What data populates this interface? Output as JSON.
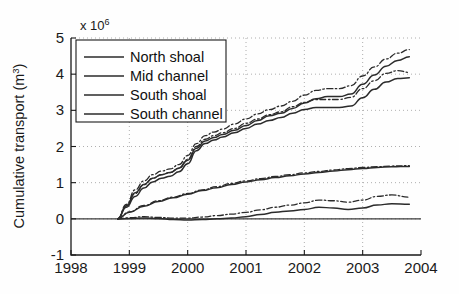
{
  "figure": {
    "axis_multiplier_base": "x 10",
    "axis_multiplier_exp": "6",
    "ylabel_main": "Cumulative transport (m",
    "ylabel_sup": "3",
    "ylabel_close": ")"
  },
  "legend": {
    "items": [
      {
        "label": "North shoal"
      },
      {
        "label": "Mid channel"
      },
      {
        "label": "South shoal"
      },
      {
        "label": "South channel"
      }
    ]
  },
  "chart_data": {
    "type": "line",
    "title": "",
    "xlabel": "",
    "ylabel": "Cumulative transport (m^3)",
    "y_multiplier": 1000000,
    "xlim": [
      1998,
      2004
    ],
    "ylim": [
      -1,
      5
    ],
    "xticks": [
      1998,
      1999,
      2000,
      2001,
      2002,
      2003,
      2004
    ],
    "xtick_labels": [
      "1998",
      "1999",
      "2000",
      "2001",
      "2002",
      "2003",
      "2004"
    ],
    "yticks": [
      -1,
      0,
      1,
      2,
      3,
      4,
      5
    ],
    "ytick_labels": [
      "-1",
      "0",
      "1",
      "2",
      "3",
      "4",
      "5"
    ],
    "grid": true,
    "grid_style": "dotted",
    "legend_position": "upper-left",
    "line_color": "#2b2b2b",
    "series": [
      {
        "name": "North shoal",
        "style": "solid",
        "x": [
          1998.8,
          1998.95,
          1999.1,
          1999.25,
          1999.4,
          1999.55,
          1999.7,
          1999.85,
          2000.0,
          2000.15,
          2000.3,
          2000.45,
          2000.6,
          2000.8,
          2001.0,
          2001.2,
          2001.4,
          2001.6,
          2001.8,
          2002.0,
          2002.2,
          2002.4,
          2002.6,
          2002.8,
          2003.0,
          2003.2,
          2003.4,
          2003.6,
          2003.8
        ],
        "values": [
          0.0,
          0.36,
          0.72,
          0.95,
          1.12,
          1.22,
          1.28,
          1.4,
          1.62,
          1.95,
          2.15,
          2.25,
          2.33,
          2.45,
          2.58,
          2.72,
          2.85,
          2.92,
          3.05,
          3.2,
          3.32,
          3.38,
          3.38,
          3.45,
          3.72,
          3.98,
          4.22,
          4.38,
          4.48
        ]
      },
      {
        "name": "North shoal (variant)",
        "style": "dashdot",
        "x": [
          1998.8,
          1998.95,
          1999.1,
          1999.25,
          1999.4,
          1999.55,
          1999.7,
          1999.85,
          2000.0,
          2000.15,
          2000.3,
          2000.45,
          2000.6,
          2000.8,
          2001.0,
          2001.2,
          2001.4,
          2001.6,
          2001.8,
          2002.0,
          2002.2,
          2002.4,
          2002.6,
          2002.8,
          2003.0,
          2003.2,
          2003.4,
          2003.6,
          2003.8
        ],
        "values": [
          0.0,
          0.4,
          0.8,
          1.05,
          1.22,
          1.32,
          1.38,
          1.5,
          1.75,
          2.08,
          2.3,
          2.4,
          2.48,
          2.62,
          2.76,
          2.9,
          3.02,
          3.12,
          3.25,
          3.42,
          3.55,
          3.6,
          3.6,
          3.68,
          3.95,
          4.2,
          4.42,
          4.58,
          4.68
        ]
      },
      {
        "name": "South shoal",
        "style": "solid",
        "x": [
          1998.8,
          1998.95,
          1999.1,
          1999.25,
          1999.4,
          1999.55,
          1999.7,
          1999.85,
          2000.0,
          2000.15,
          2000.3,
          2000.45,
          2000.6,
          2000.8,
          2001.0,
          2001.2,
          2001.4,
          2001.6,
          2001.8,
          2002.0,
          2002.2,
          2002.4,
          2002.6,
          2002.8,
          2003.0,
          2003.2,
          2003.4,
          2003.6,
          2003.8
        ],
        "values": [
          0.0,
          0.32,
          0.62,
          0.85,
          1.02,
          1.12,
          1.18,
          1.3,
          1.52,
          1.88,
          2.08,
          2.18,
          2.26,
          2.38,
          2.5,
          2.62,
          2.72,
          2.8,
          2.92,
          3.02,
          3.08,
          3.08,
          3.08,
          3.12,
          3.35,
          3.58,
          3.78,
          3.88,
          3.9
        ]
      },
      {
        "name": "South shoal (variant)",
        "style": "dashdot",
        "x": [
          1998.8,
          1998.95,
          1999.1,
          1999.25,
          1999.4,
          1999.55,
          1999.7,
          1999.85,
          2000.0,
          2000.15,
          2000.3,
          2000.45,
          2000.6,
          2000.8,
          2001.0,
          2001.2,
          2001.4,
          2001.6,
          2001.8,
          2002.0,
          2002.2,
          2002.4,
          2002.6,
          2002.8,
          2003.0,
          2003.2,
          2003.4,
          2003.6,
          2003.8
        ],
        "values": [
          0.0,
          0.36,
          0.7,
          0.94,
          1.12,
          1.22,
          1.28,
          1.4,
          1.64,
          2.0,
          2.2,
          2.3,
          2.38,
          2.5,
          2.64,
          2.76,
          2.88,
          2.96,
          3.1,
          3.22,
          3.3,
          3.3,
          3.3,
          3.36,
          3.6,
          3.82,
          4.02,
          4.1,
          4.05
        ]
      },
      {
        "name": "Mid channel",
        "style": "solid",
        "x": [
          1998.8,
          1999.0,
          1999.25,
          1999.5,
          1999.75,
          2000.0,
          2000.25,
          2000.5,
          2000.75,
          2001.0,
          2001.25,
          2001.5,
          2001.75,
          2002.0,
          2002.25,
          2002.5,
          2002.75,
          2003.0,
          2003.25,
          2003.5,
          2003.8
        ],
        "values": [
          0.0,
          0.18,
          0.35,
          0.48,
          0.58,
          0.68,
          0.78,
          0.86,
          0.95,
          1.02,
          1.08,
          1.14,
          1.19,
          1.24,
          1.28,
          1.32,
          1.36,
          1.39,
          1.42,
          1.44,
          1.45
        ]
      },
      {
        "name": "Mid channel (variant)",
        "style": "dashdot",
        "x": [
          1998.8,
          1999.0,
          1999.25,
          1999.5,
          1999.75,
          2000.0,
          2000.25,
          2000.5,
          2000.75,
          2001.0,
          2001.25,
          2001.5,
          2001.75,
          2002.0,
          2002.25,
          2002.5,
          2002.75,
          2003.0,
          2003.25,
          2003.5,
          2003.8
        ],
        "values": [
          0.0,
          0.19,
          0.37,
          0.5,
          0.6,
          0.7,
          0.8,
          0.89,
          0.98,
          1.05,
          1.11,
          1.17,
          1.22,
          1.27,
          1.31,
          1.35,
          1.39,
          1.42,
          1.44,
          1.46,
          1.47
        ]
      },
      {
        "name": "South channel",
        "style": "solid",
        "x": [
          1998.8,
          1999.0,
          1999.25,
          1999.5,
          1999.75,
          2000.0,
          2000.25,
          2000.5,
          2000.75,
          2001.0,
          2001.25,
          2001.5,
          2001.75,
          2002.0,
          2002.25,
          2002.5,
          2002.75,
          2003.0,
          2003.25,
          2003.5,
          2003.8
        ],
        "values": [
          0.0,
          0.01,
          0.02,
          0.01,
          -0.02,
          -0.03,
          -0.02,
          0.0,
          0.02,
          0.06,
          0.12,
          0.18,
          0.22,
          0.26,
          0.32,
          0.3,
          0.26,
          0.3,
          0.38,
          0.42,
          0.4
        ]
      },
      {
        "name": "South channel (variant)",
        "style": "dashdot",
        "x": [
          1998.8,
          1999.0,
          1999.25,
          1999.5,
          1999.75,
          2000.0,
          2000.25,
          2000.5,
          2000.75,
          2001.0,
          2001.25,
          2001.5,
          2001.75,
          2002.0,
          2002.25,
          2002.5,
          2002.75,
          2003.0,
          2003.25,
          2003.5,
          2003.8
        ],
        "values": [
          0.0,
          0.03,
          0.06,
          0.04,
          0.02,
          0.02,
          0.05,
          0.09,
          0.13,
          0.18,
          0.25,
          0.32,
          0.38,
          0.44,
          0.52,
          0.5,
          0.46,
          0.52,
          0.62,
          0.66,
          0.6
        ]
      }
    ]
  }
}
